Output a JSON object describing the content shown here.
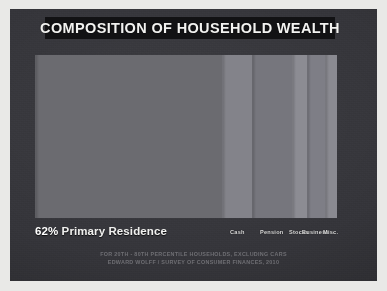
{
  "poster": {
    "title": "COMPOSITION OF HOUSEHOLD WEALTH",
    "background_color": "#35353a",
    "title_bar_color": "#121214",
    "title_color": "#f2f2f0"
  },
  "chart_data": {
    "type": "bar",
    "orientation": "horizontal-stacked",
    "title": "COMPOSITION OF HOUSEHOLD WEALTH",
    "xlabel": "",
    "ylabel": "",
    "legend": "inline-labels-below-bar",
    "grid": false,
    "unit": "percent",
    "total": 100,
    "categories": [
      "Primary Residence",
      "Cash",
      "Pension",
      "Stocks",
      "Business",
      "Misc."
    ],
    "values": [
      62,
      10,
      13,
      5,
      6,
      4
    ],
    "colors": [
      "#6b6b70",
      "#83838a",
      "#76767d",
      "#8c8c93",
      "#7e7e86",
      "#8a8a91"
    ],
    "labels": [
      {
        "text": "62% Primary Residence",
        "category": "Primary Residence"
      },
      {
        "text": "Cash",
        "category": "Cash"
      },
      {
        "text": "Pension",
        "category": "Pension"
      },
      {
        "text": "Stocks",
        "category": "Stocks"
      },
      {
        "text": "Business",
        "category": "Business"
      },
      {
        "text": "Misc.",
        "category": "Misc."
      }
    ],
    "annotations": [
      "FOR 20TH - 80TH PERCENTILE HOUSEHOLDS, EXCLUDING CARS",
      "EDWARD WOLFF / SURVEY OF CONSUMER FINANCES, 2010"
    ]
  },
  "labels": {
    "primary_pct": "62%",
    "primary_name": " Primary Residence",
    "cash": "Cash",
    "pension": "Pension",
    "stocks": "Stocks",
    "business": "Business",
    "misc": "Misc."
  },
  "footer": {
    "line1": "FOR 20TH - 80TH PERCENTILE HOUSEHOLDS, EXCLUDING CARS",
    "line2": "EDWARD WOLFF / SURVEY OF CONSUMER FINANCES, 2010"
  }
}
